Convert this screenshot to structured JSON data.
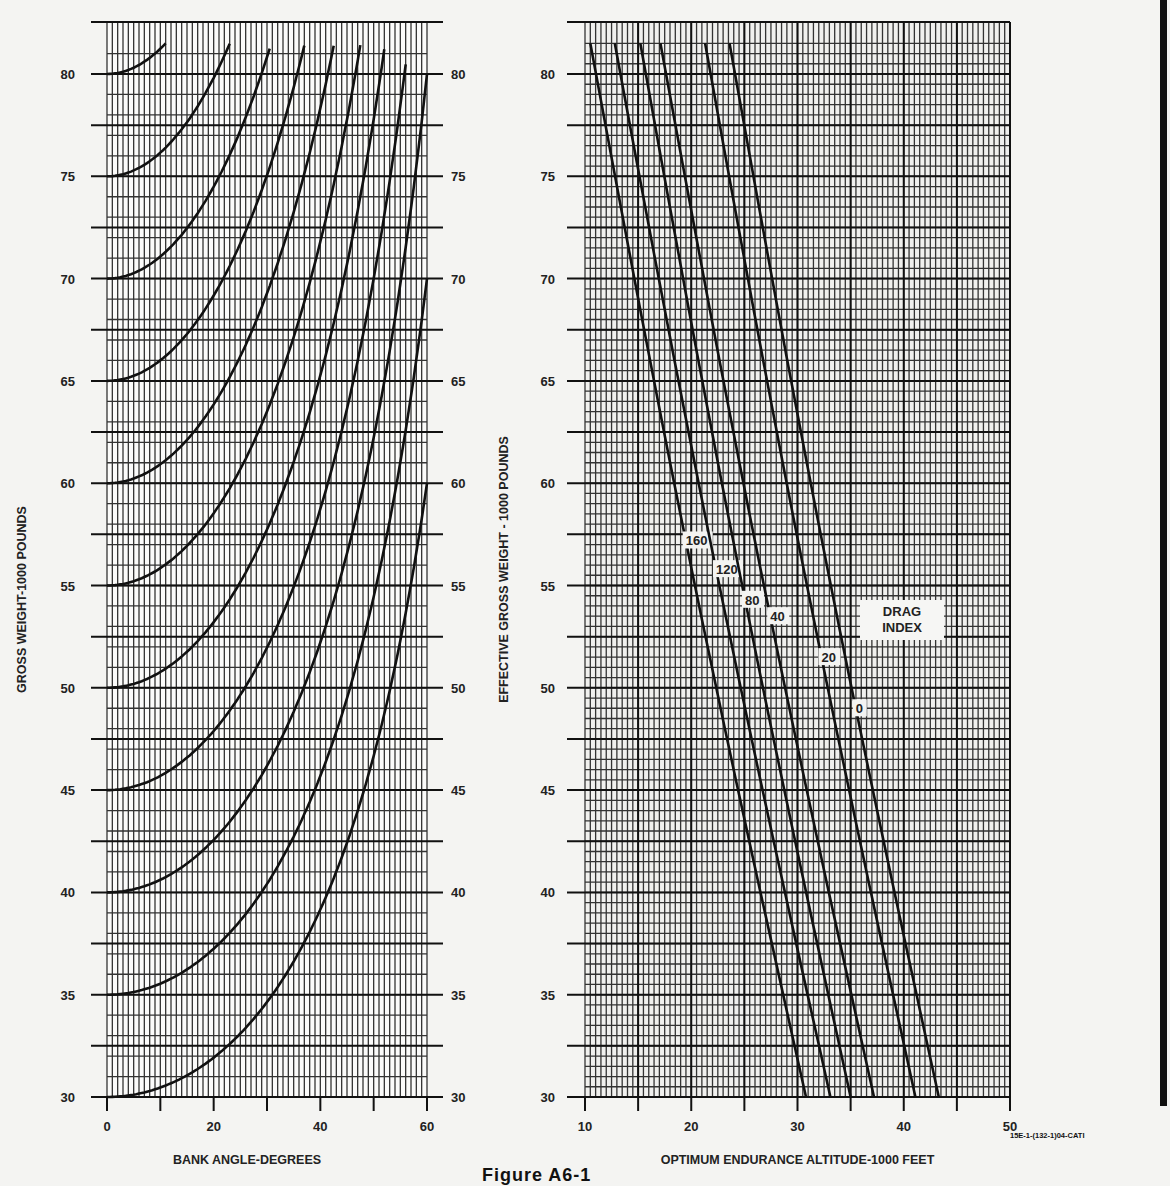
{
  "figure": {
    "caption": "Figure A6-1",
    "doc_id": "15E-1-(132-1)04-CATI"
  },
  "chart_data": [
    {
      "type": "line",
      "title": "",
      "xlabel": "BANK ANGLE-DEGREES",
      "ylabel": "GROSS WEIGHT-1000 POUNDS",
      "ylabel_right": "",
      "xlim": [
        0,
        60
      ],
      "ylim": [
        30,
        81.5
      ],
      "x_ticks": [
        0,
        20,
        40,
        60
      ],
      "x_minor_ticks": [
        10,
        30,
        50
      ],
      "y_ticks": [
        30,
        35,
        40,
        45,
        50,
        55,
        60,
        65,
        70,
        75,
        80
      ],
      "y_tick_labels_both_sides": true,
      "grid": true,
      "legend": null,
      "description": "Effective gross weight vs bank angle; each curve starts at a gross weight at 0 deg and rises as weight / cos(bank)",
      "series": [
        {
          "name": "GW 30",
          "start_weight": 30
        },
        {
          "name": "GW 35",
          "start_weight": 35
        },
        {
          "name": "GW 40",
          "start_weight": 40
        },
        {
          "name": "GW 45",
          "start_weight": 45
        },
        {
          "name": "GW 50",
          "start_weight": 50
        },
        {
          "name": "GW 55",
          "start_weight": 55
        },
        {
          "name": "GW 60",
          "start_weight": 60
        },
        {
          "name": "GW 65",
          "start_weight": 65
        },
        {
          "name": "GW 70",
          "start_weight": 70
        },
        {
          "name": "GW 75",
          "start_weight": 75
        },
        {
          "name": "GW 80",
          "start_weight": 80
        }
      ]
    },
    {
      "type": "line",
      "title": "",
      "xlabel": "OPTIMUM ENDURANCE ALTITUDE-1000 FEET",
      "ylabel": "EFFECTIVE GROSS WEIGHT - 1000 POUNDS",
      "xlim": [
        10,
        50
      ],
      "ylim": [
        30,
        81.5
      ],
      "x_ticks": [
        10,
        20,
        30,
        40,
        50
      ],
      "x_minor_ticks": [
        15,
        25,
        35,
        45
      ],
      "y_ticks": [
        30,
        35,
        40,
        45,
        50,
        55,
        60,
        65,
        70,
        75,
        80
      ],
      "grid": true,
      "legend": {
        "title": "DRAG INDEX",
        "position": "inline"
      },
      "series": [
        {
          "name": "160",
          "label": "160",
          "x": [
            10.5,
            30.8
          ],
          "y": [
            81.5,
            30
          ]
        },
        {
          "name": "120",
          "label": "120",
          "x": [
            12.8,
            33.1
          ],
          "y": [
            81.5,
            30
          ]
        },
        {
          "name": "80",
          "label": "80",
          "x": [
            15.2,
            35.0
          ],
          "y": [
            81.5,
            30
          ]
        },
        {
          "name": "40",
          "label": "40",
          "x": [
            17.1,
            37.2
          ],
          "y": [
            81.5,
            30
          ]
        },
        {
          "name": "20",
          "label": "20",
          "x": [
            21.3,
            41.1
          ],
          "y": [
            81.5,
            30
          ]
        },
        {
          "name": "0",
          "label": "0",
          "x": [
            23.6,
            43.3
          ],
          "y": [
            81.5,
            30
          ]
        }
      ]
    }
  ]
}
